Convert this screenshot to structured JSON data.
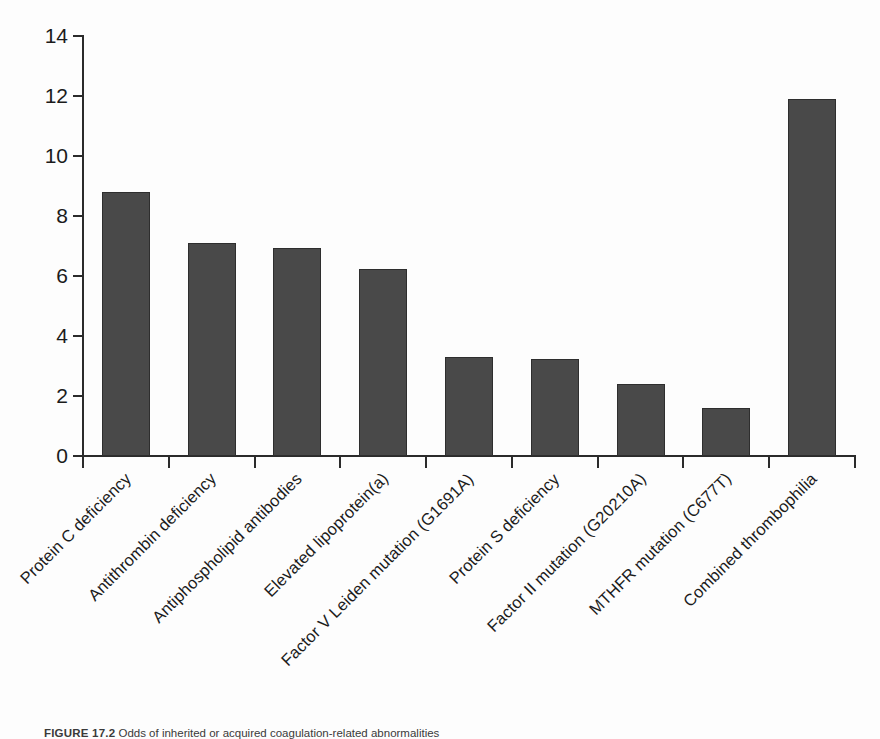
{
  "chart_data": {
    "type": "bar",
    "title": "",
    "xlabel": "",
    "ylabel": "",
    "ylim": [
      0,
      14
    ],
    "ytick_values": [
      0,
      2,
      4,
      6,
      8,
      10,
      12,
      14
    ],
    "ytick_labels": [
      "0",
      "2",
      "4",
      "6",
      "8",
      "10",
      "12",
      "14"
    ],
    "grid": false,
    "legend": false,
    "bar_color": "#494949",
    "bar_edge_color": "#2e2e2e",
    "axis_color": "#2b2b2b",
    "categories": [
      "Protein C deficiency",
      "Antithrombin deficiency",
      "Antiphospholipid antibodies",
      "Elevated lipoprotein(a)",
      "Factor V Leiden mutation (G1691A)",
      "Protein S deficiency",
      "Factor II mutation (G20210A)",
      "MTHFR mutation (C677T)",
      "Combined thrombophilia"
    ],
    "values": [
      8.8,
      7.1,
      6.95,
      6.25,
      3.3,
      3.25,
      2.4,
      1.6,
      11.9
    ]
  },
  "caption": {
    "figure_number": "FIGURE 17.2",
    "text": "Odds of inherited or acquired coagulation-related abnormalities"
  }
}
